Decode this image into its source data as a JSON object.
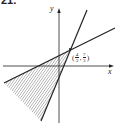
{
  "problem_number": "21.",
  "diagram": {
    "x_axis_label": "x",
    "y_axis_label": "y",
    "intersection_point": {
      "open": "(",
      "x_num": "4",
      "x_den": "3",
      "sep": ",",
      "y_num": "7",
      "y_den": "3",
      "close": ")"
    },
    "colors": {
      "line": "#222222",
      "hatch": "#444444",
      "background": "#ffffff"
    },
    "shaded_region": "triangle bounded by two lines below/left of intersection"
  }
}
